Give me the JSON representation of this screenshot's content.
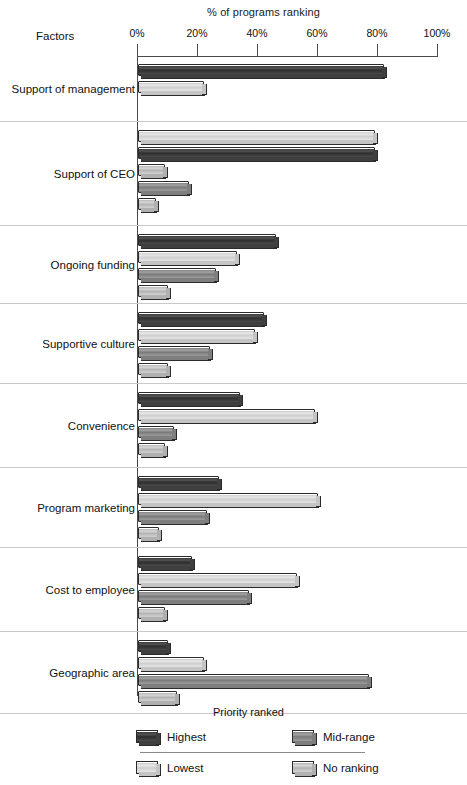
{
  "chart_data": {
    "type": "bar",
    "orientation": "horizontal",
    "title": "% of programs ranking",
    "xlabel": "% of programs ranking",
    "ylabel": "Factors",
    "xlim": [
      0,
      100
    ],
    "grid": false,
    "legend_position": "bottom",
    "legend_title": "Priority ranked",
    "axis_ticks": [
      "0%",
      "20%",
      "40%",
      "60%",
      "80%",
      "100%"
    ],
    "axis_tick_values": [
      0,
      20,
      40,
      60,
      80,
      100
    ],
    "categories": [
      "Support of management",
      "Support of CEO",
      "Ongoing funding",
      "Supportive culture",
      "Convenience",
      "Program marketing",
      "Cost to employee",
      "Geographic area"
    ],
    "series": [
      {
        "name": "Highest",
        "key": "highest",
        "values": [
          82,
          0,
          46,
          42,
          34,
          27,
          18,
          10
        ]
      },
      {
        "name": "Lowest",
        "key": "lowest",
        "values": [
          22,
          79,
          33,
          39,
          59,
          60,
          53,
          22
        ]
      },
      {
        "name": "Mid-range",
        "key": "midrange",
        "values": [
          0,
          79,
          26,
          24,
          12,
          23,
          37,
          77
        ]
      },
      {
        "name": "No ranking",
        "key": "noranking",
        "values": [
          0,
          9,
          10,
          10,
          9,
          7,
          9,
          13
        ]
      }
    ],
    "group_bar_order": [
      "highest",
      "lowest",
      "midrange",
      "noranking"
    ],
    "groups": [
      {
        "label": "Support of management",
        "bars": [
          {
            "series": "Highest",
            "value": 82
          },
          {
            "series": "Lowest",
            "value": 22
          },
          {
            "series": "Mid-range",
            "value": 0
          },
          {
            "series": "No ranking",
            "value": 0
          }
        ]
      },
      {
        "label": "Support of CEO",
        "bars": [
          {
            "series": "Lowest",
            "value": 79
          },
          {
            "series": "Highest",
            "value": 79
          },
          {
            "series": "No ranking",
            "value": 9
          },
          {
            "series": "Mid-range",
            "value": 17
          },
          {
            "series": "No ranking",
            "value": 6
          }
        ]
      },
      {
        "label": "Ongoing funding",
        "bars": [
          {
            "series": "Highest",
            "value": 46
          },
          {
            "series": "Lowest",
            "value": 33
          },
          {
            "series": "Mid-range",
            "value": 26
          },
          {
            "series": "No ranking",
            "value": 10
          }
        ]
      },
      {
        "label": "Supportive culture",
        "bars": [
          {
            "series": "Highest",
            "value": 42
          },
          {
            "series": "Lowest",
            "value": 39
          },
          {
            "series": "Mid-range",
            "value": 24
          },
          {
            "series": "No ranking",
            "value": 10
          }
        ]
      },
      {
        "label": "Convenience",
        "bars": [
          {
            "series": "Highest",
            "value": 34
          },
          {
            "series": "Lowest",
            "value": 59
          },
          {
            "series": "Mid-range",
            "value": 12
          },
          {
            "series": "No ranking",
            "value": 9
          }
        ]
      },
      {
        "label": "Program marketing",
        "bars": [
          {
            "series": "Highest",
            "value": 27
          },
          {
            "series": "Lowest",
            "value": 60
          },
          {
            "series": "Mid-range",
            "value": 23
          },
          {
            "series": "No ranking",
            "value": 7
          }
        ]
      },
      {
        "label": "Cost to employee",
        "bars": [
          {
            "series": "Highest",
            "value": 18
          },
          {
            "series": "Lowest",
            "value": 53
          },
          {
            "series": "Mid-range",
            "value": 37
          },
          {
            "series": "No ranking",
            "value": 9
          }
        ]
      },
      {
        "label": "Geographic area",
        "bars": [
          {
            "series": "Highest",
            "value": 10
          },
          {
            "series": "Lowest",
            "value": 22
          },
          {
            "series": "Mid-range",
            "value": 77
          },
          {
            "series": "No ranking",
            "value": 13
          }
        ]
      }
    ]
  },
  "header": {
    "chart_title": "% of programs ranking",
    "factors_label": "Factors"
  },
  "axis": {
    "ticks": [
      {
        "label": "0%",
        "value": 0
      },
      {
        "label": "20%",
        "value": 20
      },
      {
        "label": "40%",
        "value": 40
      },
      {
        "label": "60%",
        "value": 60
      },
      {
        "label": "80%",
        "value": 80
      },
      {
        "label": "100%",
        "value": 100
      }
    ]
  },
  "legend": {
    "title": "Priority ranked",
    "items": [
      {
        "label": "Highest",
        "key": "highest",
        "color": "#3a3a3a"
      },
      {
        "label": "Mid-range",
        "key": "midrange",
        "color": "#8a8a8a"
      },
      {
        "label": "Lowest",
        "key": "lowest",
        "color": "#dcdcdc"
      },
      {
        "label": "No ranking",
        "key": "noranking",
        "color": "#c4c4c4"
      }
    ]
  },
  "colors": {
    "highest": "#3a3a3a",
    "midrange": "#8a8a8a",
    "lowest": "#dcdcdc",
    "noranking": "#c4c4c4",
    "axis": "#4a4a4a",
    "background": "#ffffff"
  }
}
